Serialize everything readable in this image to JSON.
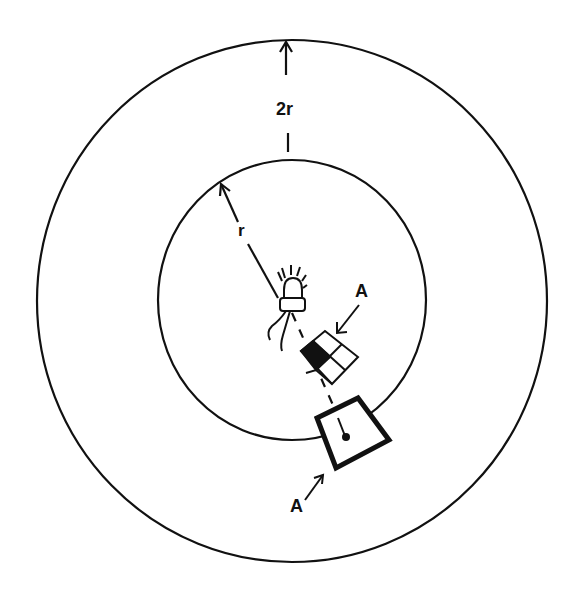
{
  "diagram": {
    "labels": {
      "outer_distance": "2r",
      "inner_radius": "r",
      "surface_top": "A",
      "surface_bottom": "A"
    },
    "elements": {
      "outer_circle": "circle of radius 2r",
      "inner_circle": "circle of radius r",
      "light_source": "point light source (bulb) at center",
      "small_patch": "checkered surface element A at distance r",
      "large_patch": "surface element A at distance 2r"
    },
    "colors": {
      "ink": "#111111",
      "background": "#ffffff"
    }
  }
}
